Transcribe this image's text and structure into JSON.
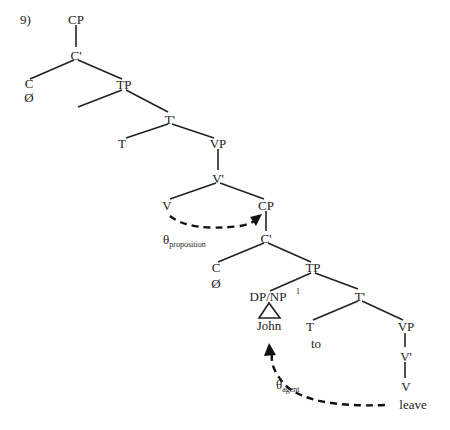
{
  "example_number": "9)",
  "tree": {
    "nodes": {
      "cp_top": "CP",
      "cbar_top": "C'",
      "c_top": "C",
      "c_top_word": "Ø",
      "tp_top": "TP",
      "tbar_top": "T'",
      "t_top": "T",
      "vp_top": "VP",
      "vbar_top": "V'",
      "v_top": "V",
      "cp_emb": "CP",
      "cbar_emb": "C'",
      "c_emb": "C",
      "c_emb_word": "Ø",
      "tp_emb": "TP",
      "dpnp_emb": "DP/NP",
      "dpnp_index": "1",
      "john": "John",
      "tbar_emb": "T'",
      "t_emb": "T",
      "t_emb_word": "to",
      "vp_emb": "VP",
      "vbar_emb": "V'",
      "v_emb": "V",
      "v_emb_word": "leave"
    }
  },
  "arrows": {
    "proposition": {
      "theta": "θ",
      "role": "proposition"
    },
    "agent": {
      "theta": "θ",
      "role": "agent"
    }
  }
}
